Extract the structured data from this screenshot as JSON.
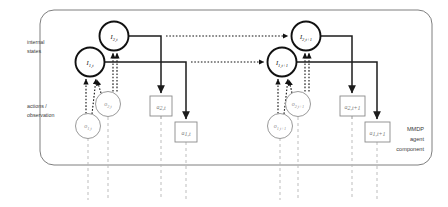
{
  "figure": {
    "title_text": "MMDP agent component diagram",
    "border_color": "#6f6f6f",
    "solid_color": "#1c1c1c",
    "gray_color": "#9a9a9a",
    "box_color": "#8a8a8a",
    "dotted_color": "#1c1c1c",
    "gray_dash_color": "#b5b5b5"
  },
  "side_labels": {
    "internal_states_line1": "internal",
    "internal_states_line2": "states",
    "actions_line1": "actions /",
    "actions_line2": "observation"
  },
  "corner_label": {
    "line1": "MMDP",
    "line2": "agent",
    "line3": "component"
  },
  "nodes": {
    "internal_states": [
      {
        "id": "I2t",
        "label": "I2,t",
        "sub": "2,t",
        "base": "I",
        "cx": 114,
        "cy": 36,
        "r": 14.5,
        "style": "bold"
      },
      {
        "id": "I1t",
        "label": "I1,t",
        "sub": "1,t",
        "base": "I",
        "cx": 90,
        "cy": 62,
        "r": 14.5,
        "style": "bold"
      },
      {
        "id": "I2t1",
        "label": "I2,t+1",
        "sub": "2,t+1",
        "base": "I",
        "cx": 306,
        "cy": 36,
        "r": 14.5,
        "style": "bold"
      },
      {
        "id": "I1t1",
        "label": "I1,t+1",
        "sub": "1,t+1",
        "base": "I",
        "cx": 282,
        "cy": 62,
        "r": 14.5,
        "style": "bold"
      }
    ],
    "observations": [
      {
        "id": "o2t",
        "label": "o2,t",
        "sub": "2,t",
        "base": "o",
        "cx": 108,
        "cy": 104,
        "r": 12.5,
        "style": "gray"
      },
      {
        "id": "o1t",
        "label": "o1,t",
        "sub": "1,t",
        "base": "o",
        "cx": 88,
        "cy": 126,
        "r": 12.5,
        "style": "gray"
      },
      {
        "id": "o2t1",
        "label": "o2,t+1",
        "sub": "2,t+1",
        "base": "o",
        "cx": 298,
        "cy": 104,
        "r": 12.5,
        "style": "gray"
      },
      {
        "id": "o1t1",
        "label": "o1,t+1",
        "sub": "1,t+1",
        "base": "o",
        "cx": 280,
        "cy": 126,
        "r": 12.5,
        "style": "gray"
      }
    ],
    "actions": [
      {
        "id": "a2t",
        "label": "a2,t",
        "sub": "2,t",
        "base": "a",
        "x": 150,
        "y": 96,
        "w": 22,
        "h": 20
      },
      {
        "id": "a1t",
        "label": "a1,t",
        "sub": "1,t",
        "base": "a",
        "x": 175,
        "y": 122,
        "w": 22,
        "h": 20
      },
      {
        "id": "a2t1",
        "label": "a2,t+1",
        "sub": "2,t+1",
        "base": "a",
        "x": 340,
        "y": 96,
        "w": 25,
        "h": 20
      },
      {
        "id": "a1t1",
        "label": "a1,t+1",
        "sub": "1,t+1",
        "base": "a",
        "x": 365,
        "y": 122,
        "w": 25,
        "h": 20
      }
    ]
  },
  "time_slices": [
    "t",
    "t+1"
  ],
  "edge_legend": {
    "solid": "internal state to action (policy)",
    "dotted": "observation to internal state (update)",
    "gray_dashed": "time continuation"
  }
}
